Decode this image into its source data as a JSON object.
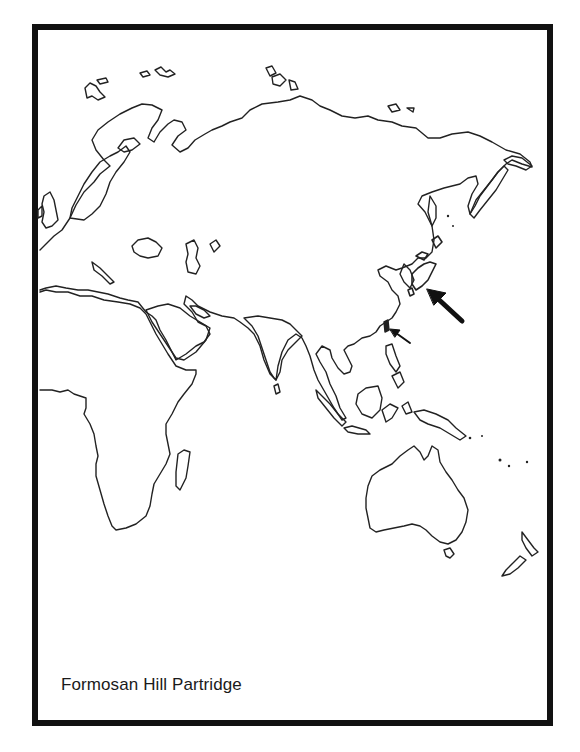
{
  "figure": {
    "caption": "Formosan Hill Partridge",
    "map_region": "Eastern Hemisphere (Europe, Africa, Asia, Australia)",
    "colors": {
      "frame": "#111111",
      "coastline": "#222222",
      "background": "#ffffff"
    },
    "markers": [
      {
        "name": "large-arrow",
        "points_to": "Japan area / East Asia coast",
        "tip": [
          427,
          289
        ],
        "tail": [
          462,
          321
        ]
      },
      {
        "name": "small-arrow",
        "points_to": "Taiwan",
        "tip": [
          390,
          329
        ],
        "tail": [
          410,
          343
        ]
      }
    ]
  }
}
